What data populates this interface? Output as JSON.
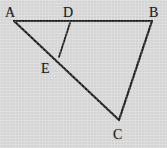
{
  "figure": {
    "kind": "geometry-diagram",
    "background_color": "#d8d8d8",
    "stroke_color": "#1b1b1b",
    "label_color": "#1b1b1b",
    "stroke_width": 2.2,
    "width": 167,
    "height": 148
  },
  "points": {
    "A": {
      "label": "A",
      "x": 14,
      "y": 21,
      "label_x": 5,
      "label_y": 6
    },
    "B": {
      "label": "B",
      "x": 152,
      "y": 21,
      "label_x": 149,
      "label_y": 6
    },
    "C": {
      "label": "C",
      "x": 119,
      "y": 120,
      "label_x": 113,
      "label_y": 128
    },
    "D": {
      "label": "D",
      "x": 70,
      "y": 23,
      "label_x": 63,
      "label_y": 6
    },
    "E": {
      "label": "E",
      "x": 59,
      "y": 57,
      "label_x": 41,
      "label_y": 62
    }
  },
  "segments": [
    {
      "name": "segment-AB",
      "from": "A",
      "to": "B",
      "path": "M 14 21 L 152 21"
    },
    {
      "name": "segment-BC",
      "from": "B",
      "to": "C",
      "path": "M 152 21 L 119 120"
    },
    {
      "name": "segment-AC",
      "from": "A",
      "to": "C",
      "path": "M 14 21 L 119 120"
    },
    {
      "name": "segment-DE",
      "from": "D",
      "to": "E",
      "path": "M 70 23 L 59 57"
    }
  ]
}
